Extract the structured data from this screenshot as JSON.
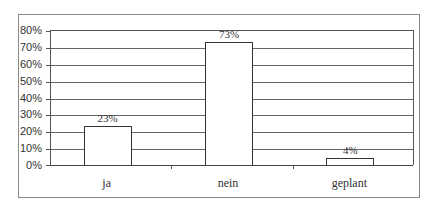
{
  "chart_data": {
    "type": "bar",
    "title": "",
    "xlabel": "",
    "ylabel": "",
    "categories": [
      "ja",
      "nein",
      "geplant"
    ],
    "values": [
      23,
      73,
      4
    ],
    "value_labels": [
      "23%",
      "73%",
      "4%"
    ],
    "ylim": [
      0,
      80
    ],
    "yticks": [
      "0%",
      "10%",
      "20%",
      "30%",
      "40%",
      "50%",
      "60%",
      "70%",
      "80%"
    ],
    "grid": true,
    "legend": null,
    "bar_fill": "#ffffff",
    "bar_edge": "#333333"
  }
}
